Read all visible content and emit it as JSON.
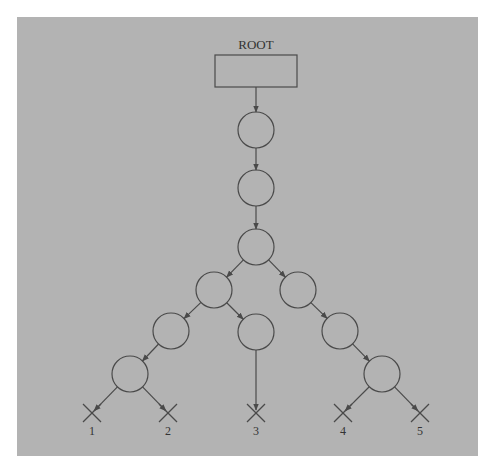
{
  "diagram": {
    "type": "tree",
    "background": "#b3b3b3",
    "stroke_color": "#4a4a4a",
    "root": {
      "label": "ROOT",
      "box": {
        "x": 215,
        "y": 55,
        "w": 82,
        "h": 32
      },
      "label_pos": {
        "x": 256,
        "y": 49
      }
    },
    "node_radius": 18,
    "nodes": [
      {
        "id": "n1",
        "cx": 256,
        "cy": 130
      },
      {
        "id": "n2",
        "cx": 256,
        "cy": 188
      },
      {
        "id": "n3",
        "cx": 256,
        "cy": 247
      },
      {
        "id": "n4",
        "cx": 214,
        "cy": 290
      },
      {
        "id": "n5",
        "cx": 298,
        "cy": 290
      },
      {
        "id": "n6",
        "cx": 171,
        "cy": 331
      },
      {
        "id": "n7",
        "cx": 256,
        "cy": 332
      },
      {
        "id": "n8",
        "cx": 340,
        "cy": 331
      },
      {
        "id": "n9",
        "cx": 130,
        "cy": 374
      },
      {
        "id": "n10",
        "cx": 382,
        "cy": 374
      }
    ],
    "leaves": [
      {
        "id": "leaf1",
        "label": "1",
        "cx": 92,
        "cy": 413
      },
      {
        "id": "leaf2",
        "label": "2",
        "cx": 168,
        "cy": 413
      },
      {
        "id": "leaf3",
        "label": "3",
        "cx": 256,
        "cy": 413
      },
      {
        "id": "leaf4",
        "label": "4",
        "cx": 343,
        "cy": 413
      },
      {
        "id": "leaf5",
        "label": "5",
        "cx": 420,
        "cy": 413
      }
    ],
    "edges": [
      [
        "root",
        "n1"
      ],
      [
        "n1",
        "n2"
      ],
      [
        "n2",
        "n3"
      ],
      [
        "n3",
        "n4"
      ],
      [
        "n3",
        "n5"
      ],
      [
        "n4",
        "n6"
      ],
      [
        "n4",
        "n7"
      ],
      [
        "n5",
        "n8"
      ],
      [
        "n6",
        "n9"
      ],
      [
        "n8",
        "n10"
      ],
      [
        "n9",
        "leaf1"
      ],
      [
        "n9",
        "leaf2"
      ],
      [
        "n7",
        "leaf3"
      ],
      [
        "n10",
        "leaf4"
      ],
      [
        "n10",
        "leaf5"
      ]
    ]
  }
}
